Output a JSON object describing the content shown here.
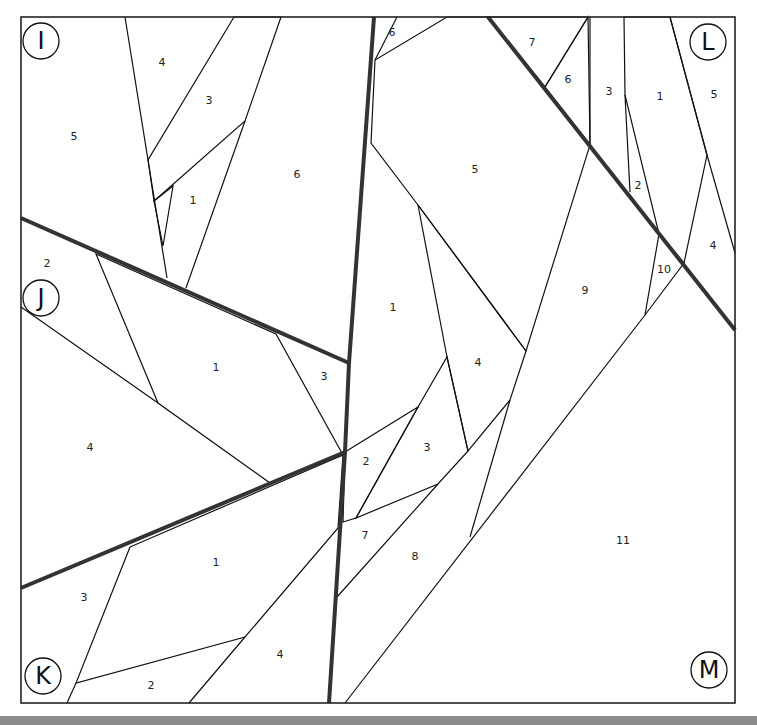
{
  "diagram": {
    "type": "foundation paper piecing pattern",
    "colors": {
      "dark_fabric": "#8a8a8a",
      "light_fabric": "#c8c8c8",
      "background_fabric": "#ffffff",
      "line": "#111111",
      "bottom_bar": "#8c8c8c"
    },
    "sections": {
      "I": {
        "letter": "I",
        "pieces": [
          {
            "num": "1",
            "fill": "white"
          },
          {
            "num": "2",
            "fill": "light"
          },
          {
            "num": "3",
            "fill": "light"
          },
          {
            "num": "4",
            "fill": "white"
          },
          {
            "num": "5",
            "fill": "white"
          },
          {
            "num": "6",
            "fill": "white"
          }
        ]
      },
      "J": {
        "letter": "J",
        "pieces": [
          {
            "num": "1",
            "fill": "dark"
          },
          {
            "num": "2",
            "fill": "white"
          },
          {
            "num": "3",
            "fill": "white"
          },
          {
            "num": "4",
            "fill": "white"
          }
        ]
      },
      "K": {
        "letter": "K",
        "pieces": [
          {
            "num": "1",
            "fill": "dark"
          },
          {
            "num": "2",
            "fill": "white"
          },
          {
            "num": "3",
            "fill": "white"
          },
          {
            "num": "4",
            "fill": "white"
          }
        ]
      },
      "L": {
        "letter": "L",
        "pieces": [
          {
            "num": "1",
            "fill": "light"
          },
          {
            "num": "2",
            "fill": "white"
          },
          {
            "num": "3",
            "fill": "white"
          },
          {
            "num": "4",
            "fill": "white"
          },
          {
            "num": "5",
            "fill": "white"
          },
          {
            "num": "6",
            "fill": "dark"
          },
          {
            "num": "7",
            "fill": "light"
          },
          {
            "num": "10",
            "fill": "light"
          }
        ]
      },
      "M": {
        "letter": "M",
        "pieces": [
          {
            "num": "1",
            "fill": "white"
          },
          {
            "num": "2",
            "fill": "dark"
          },
          {
            "num": "3",
            "fill": "dark"
          },
          {
            "num": "4",
            "fill": "dark"
          },
          {
            "num": "5",
            "fill": "dark"
          },
          {
            "num": "6",
            "fill": "white"
          },
          {
            "num": "7",
            "fill": "white"
          },
          {
            "num": "8",
            "fill": "white"
          },
          {
            "num": "9",
            "fill": "white"
          },
          {
            "num": "11",
            "fill": "white"
          }
        ]
      }
    },
    "labels": {
      "I1": "1",
      "I2": "",
      "I3": "3",
      "I4": "4",
      "I5": "5",
      "I6": "6",
      "J1": "1",
      "J2": "2",
      "J3": "3",
      "J4": "4",
      "K1": "1",
      "K2": "2",
      "K3": "3",
      "K4": "4",
      "L1": "1",
      "L2": "2",
      "L3": "3",
      "L4": "4",
      "L5": "5",
      "L6": "6",
      "L7": "7",
      "L10": "10",
      "M1": "1",
      "M2": "2",
      "M3": "3",
      "M4": "4",
      "M5": "5",
      "M6": "6",
      "M7": "7",
      "M8": "8",
      "M9": "9",
      "M11": "11"
    }
  }
}
